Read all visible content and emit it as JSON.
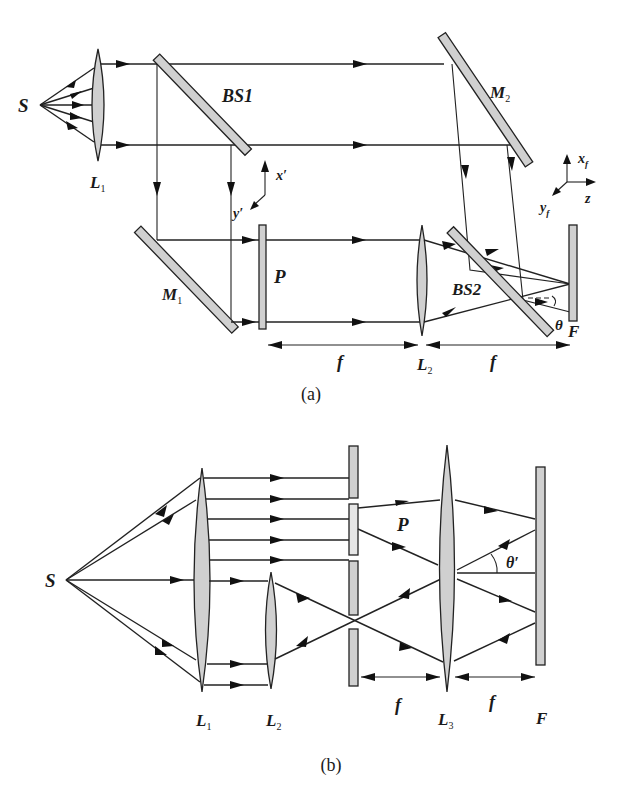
{
  "figure": {
    "panels": [
      {
        "id": "a",
        "caption": "(a)",
        "labels": {
          "source": "S",
          "lens1": "L",
          "lens1_sub": "1",
          "beam_splitter1": "BS1",
          "mirror1": "M",
          "mirror1_sub": "1",
          "mirror2": "M",
          "mirror2_sub": "2",
          "object_plane": "P",
          "lens2": "L",
          "lens2_sub": "2",
          "beam_splitter2": "BS2",
          "focal_plane": "F",
          "focal_length_1": "f",
          "focal_length_2": "f",
          "angle": "θ",
          "axis_x_prime": "x′",
          "axis_y_prime": "y′",
          "axis_xf": "x",
          "axis_xf_sub": "f",
          "axis_yf": "y",
          "axis_yf_sub": "f",
          "axis_z": "z"
        }
      },
      {
        "id": "b",
        "caption": "(b)",
        "labels": {
          "source": "S",
          "lens1": "L",
          "lens1_sub": "1",
          "lens2": "L",
          "lens2_sub": "2",
          "object_plane": "P",
          "lens3": "L",
          "lens3_sub": "3",
          "focal_plane": "F",
          "focal_length_1": "f",
          "focal_length_2": "f",
          "angle": "θ′"
        }
      }
    ]
  }
}
